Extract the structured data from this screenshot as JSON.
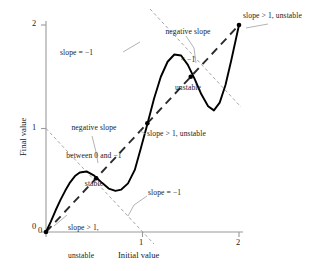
{
  "chart_data": {
    "type": "line",
    "title": "",
    "xlabel": "Initial value",
    "ylabel": "Final value",
    "xlim": [
      0,
      2
    ],
    "ylim": [
      0,
      2
    ],
    "xticks": [
      "0",
      "1",
      "2"
    ],
    "yticks": [
      "0",
      "1",
      "2"
    ],
    "xtick_values": [
      0,
      1,
      2
    ],
    "ytick_values": [
      0,
      1,
      2
    ],
    "grid": false,
    "legend": "none",
    "series": [
      {
        "name": "map curve",
        "style": "solid",
        "points": [
          [
            0.0,
            0.0
          ],
          [
            0.05,
            0.1
          ],
          [
            0.1,
            0.21
          ],
          [
            0.15,
            0.31
          ],
          [
            0.2,
            0.4
          ],
          [
            0.25,
            0.48
          ],
          [
            0.3,
            0.54
          ],
          [
            0.35,
            0.575
          ],
          [
            0.42,
            0.585
          ],
          [
            0.5,
            0.545
          ],
          [
            0.58,
            0.475
          ],
          [
            0.65,
            0.42
          ],
          [
            0.72,
            0.398
          ],
          [
            0.78,
            0.41
          ],
          [
            0.85,
            0.47
          ],
          [
            0.92,
            0.6
          ],
          [
            0.98,
            0.8
          ],
          [
            1.05,
            1.04
          ],
          [
            1.12,
            1.29
          ],
          [
            1.19,
            1.5
          ],
          [
            1.26,
            1.645
          ],
          [
            1.33,
            1.715
          ],
          [
            1.4,
            1.705
          ],
          [
            1.47,
            1.615
          ],
          [
            1.54,
            1.48
          ],
          [
            1.61,
            1.33
          ],
          [
            1.68,
            1.215
          ],
          [
            1.74,
            1.175
          ],
          [
            1.8,
            1.25
          ],
          [
            1.86,
            1.42
          ],
          [
            1.92,
            1.66
          ],
          [
            2.0,
            2.0
          ]
        ]
      },
      {
        "name": "identity line y = x",
        "style": "dashed-heavy",
        "points": [
          [
            0,
            0
          ],
          [
            2,
            2
          ]
        ]
      },
      {
        "name": "slope -1 reference line (upper)",
        "style": "dashed-thin",
        "points": [
          [
            0.0,
            1.0
          ],
          [
            1.12,
            -0.12
          ]
        ]
      },
      {
        "name": "slope -1 reference line (lower)",
        "style": "dashed-thin",
        "points": [
          [
            1.08,
            2.15
          ],
          [
            2.02,
            1.21
          ]
        ]
      }
    ],
    "fixed_points": [
      {
        "x": 0.0,
        "y": 0.0,
        "label": "slope > 1, unstable"
      },
      {
        "x": 0.52,
        "y": 0.52,
        "label": "negative slope between 0 and -1 stable"
      },
      {
        "x": 1.05,
        "y": 1.05,
        "label": "slope > 1, unstable"
      },
      {
        "x": 1.5,
        "y": 1.5,
        "label": "negative slope < -1 unstable"
      },
      {
        "x": 2.0,
        "y": 2.0,
        "label": "slope > 1, unstable"
      }
    ],
    "annotations": [
      {
        "id": "negative-slope-lt-minus-one",
        "lines": [
          "negative slope",
          "< −1",
          "unstable"
        ],
        "text": "negative slope\n< −1\nunstable",
        "anchor_point": [
          1.5,
          1.5
        ]
      },
      {
        "id": "slope-gt-1-unstable-top-right",
        "lines": [
          "slope > 1, unstable"
        ],
        "text": "slope > 1, unstable",
        "anchor_point": [
          2.0,
          2.0
        ]
      },
      {
        "id": "slope-equals-minus-one-upper",
        "lines": [
          "slope = −1"
        ],
        "text": "slope = −1",
        "anchor_point": [
          1.1,
          1.95
        ]
      },
      {
        "id": "negative-slope-between-0-and-minus-1",
        "lines": [
          "negative slope",
          "between 0 and −1",
          "stable"
        ],
        "text": "negative slope\nbetween 0 and −1\nstable",
        "anchor_point": [
          0.52,
          0.52
        ]
      },
      {
        "id": "slope-gt-1-unstable-center",
        "lines": [
          "slope > 1, unstable"
        ],
        "text": "slope > 1, unstable",
        "anchor_point": [
          1.05,
          1.05
        ]
      },
      {
        "id": "slope-equals-minus-one-lower",
        "lines": [
          "slope = −1"
        ],
        "text": "slope = −1",
        "anchor_point": [
          1.02,
          0.02
        ]
      },
      {
        "id": "slope-gt-1-unstable-bottom-left",
        "lines": [
          "slope > 1,",
          "unstable"
        ],
        "text": "slope > 1,\nunstable",
        "anchor_point": [
          0.0,
          0.0
        ]
      }
    ],
    "colors": {
      "curve": "#000000",
      "identity_line": "#2b2b2b",
      "reference_line": "#9a9a9a",
      "axis": "#9a9a9a",
      "text": "#1a1a1a"
    }
  },
  "axes": {
    "x_title": "Initial value",
    "y_title": "Final value",
    "x_ticks": [
      "0",
      "1",
      "2"
    ],
    "y_ticks": [
      "0",
      "1",
      "2"
    ]
  },
  "annotations": {
    "neg_slope_lt_m1": "negative slope\n< −1\nunstable",
    "neg_slope_lt_m1_l1": "negative slope",
    "neg_slope_lt_m1_l2": "< −1",
    "neg_slope_lt_m1_l3": "unstable",
    "top_right": "slope > 1, unstable",
    "slope_m1_upper": "slope = −1",
    "neg_slope_0_m1": "negative slope\nbetween 0 and −1\nstable",
    "neg_slope_0_m1_l1": "negative slope",
    "neg_slope_0_m1_l2": "between 0 and −1",
    "neg_slope_0_m1_l3": "stable",
    "center": "slope > 1, unstable",
    "slope_m1_lower": "slope = −1",
    "bottom_left": "slope > 1,\nunstable",
    "bottom_left_l1": "slope > 1,",
    "bottom_left_l2": "unstable"
  }
}
